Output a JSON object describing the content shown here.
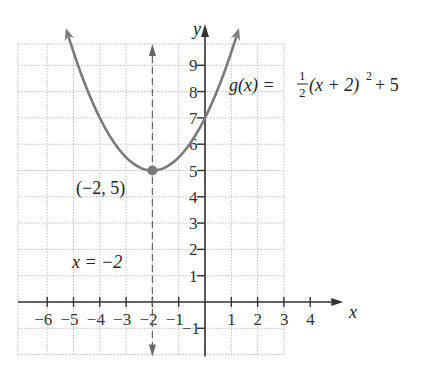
{
  "chart_data": {
    "type": "line",
    "title": "",
    "function_label": "g(x) = 1/2(x + 2)^2 + 5",
    "function_label_parts": {
      "lhs": "g(x) =",
      "frac_num": "1",
      "frac_den": "2",
      "rhs_base": "(x + 2)",
      "exp": "2",
      "rhs_tail": "+ 5"
    },
    "xlabel": "x",
    "ylabel": "y",
    "xlim": [
      -7,
      3
    ],
    "ylim": [
      -2,
      10
    ],
    "x_ticks": [
      -6,
      -5,
      -4,
      -3,
      -2,
      -1,
      1,
      2,
      3,
      4
    ],
    "x_tick_labels": [
      "−6",
      "−5",
      "−4",
      "−3",
      "−2",
      "−1",
      "1",
      "2",
      "3",
      "4"
    ],
    "y_ticks": [
      -1,
      1,
      2,
      3,
      4,
      5,
      6,
      7,
      8,
      9
    ],
    "y_tick_labels": [
      "−1",
      "1",
      "2",
      "3",
      "4",
      "5",
      "6",
      "7",
      "8",
      "9"
    ],
    "grid": true,
    "series": [
      {
        "name": "g(x)",
        "equation": "0.5*(x+2)^2+5",
        "x": [
          -6.8,
          -6,
          -5,
          -4,
          -3,
          -2,
          -1,
          0,
          0.4
        ],
        "values": [
          16.52,
          13,
          9.5,
          7,
          5.5,
          5,
          5.5,
          7,
          7.88
        ],
        "color": "#808080"
      }
    ],
    "annotations": [
      {
        "text": "(−2, 5)",
        "point": [
          -2,
          5
        ],
        "type": "vertex"
      },
      {
        "text": "x = −2",
        "type": "axis-of-symmetry",
        "line": "x = -2",
        "style": "dashed"
      }
    ]
  },
  "labels": {
    "vertex": "(−2, 5)",
    "axis_symmetry": "x = −2",
    "x_axis": "x",
    "y_axis": "y",
    "g_lhs": "g(x) =",
    "g_num": "1",
    "g_den": "2",
    "g_base": "(x + 2)",
    "g_exp": "2",
    "g_tail": "+ 5"
  },
  "colors": {
    "curve": "#7a7a7a",
    "axis": "#333333",
    "grid": "#bdbdbd",
    "dashed": "#666666"
  }
}
